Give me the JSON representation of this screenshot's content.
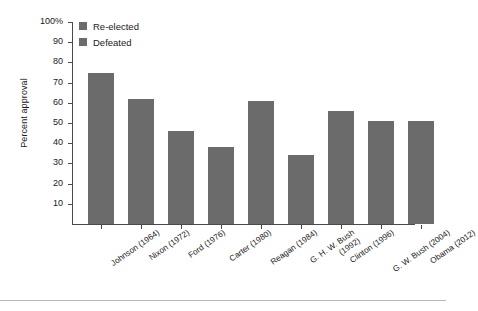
{
  "chart_data": {
    "type": "bar",
    "title": "",
    "xlabel": "",
    "ylabel": "Percent approval",
    "ylim": [
      0,
      100
    ],
    "grid": false,
    "legend_position": "top-left",
    "ytick_labels": [
      "100%",
      "90",
      "80",
      "70",
      "60",
      "50",
      "40",
      "30",
      "20",
      "10"
    ],
    "ytick_values": [
      100,
      90,
      80,
      70,
      60,
      50,
      40,
      30,
      20,
      10
    ],
    "legend": [
      {
        "label": "Re-elected",
        "color": "#6b6b6b"
      },
      {
        "label": "Defeated",
        "color": "#6b6b6b"
      }
    ],
    "categories": [
      "Johnson (1964)",
      "Nixon (1972)",
      "Ford (1976)",
      "Carter (1980)",
      "Reagan (1984)",
      "G. H. W. Bush (1992)",
      "Clinton (1996)",
      "G. W. Bush (2004)",
      "Obama (2012)"
    ],
    "category_lines": [
      [
        "Johnson (1964)"
      ],
      [
        "Nixon (1972)"
      ],
      [
        "Ford (1976)"
      ],
      [
        "Carter (1980)"
      ],
      [
        "Reagan (1984)"
      ],
      [
        "G. H. W. Bush",
        "(1992)"
      ],
      [
        "Clinton (1996)"
      ],
      [
        "G. W. Bush (2004)"
      ],
      [
        "Obama (2012)"
      ]
    ],
    "values": [
      75,
      62,
      46,
      38,
      61,
      34,
      56,
      51,
      51
    ],
    "series": [
      {
        "name": "Percent approval",
        "values": [
          75,
          62,
          46,
          38,
          61,
          34,
          56,
          51,
          51
        ],
        "outcomes": [
          "Re-elected",
          "Re-elected",
          "Defeated",
          "Defeated",
          "Re-elected",
          "Defeated",
          "Re-elected",
          "Re-elected",
          "Re-elected"
        ]
      }
    ],
    "bar_color": "#6b6b6b",
    "axis_color": "#4a4a4a"
  }
}
